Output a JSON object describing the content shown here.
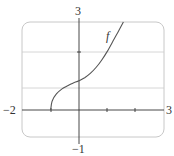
{
  "chart_data": {
    "type": "line",
    "title": "",
    "xlabel": "",
    "ylabel": "",
    "xlim": [
      -2,
      3
    ],
    "ylim": [
      -1,
      3
    ],
    "grid": true,
    "grid_lines_y": [
      0.75,
      2
    ],
    "x_tick_marks": [
      -1,
      1,
      2
    ],
    "y_tick_marks": [
      2
    ],
    "tick_labels": {
      "x_min": "−2",
      "x_max": "3",
      "y_max": "3",
      "y_min": "−1"
    },
    "series": [
      {
        "name": "f",
        "x": [
          -1,
          -0.95,
          -0.8,
          -0.6,
          -0.4,
          -0.2,
          0,
          0.2,
          0.4,
          0.6,
          0.8,
          1.0,
          1.2,
          1.4,
          1.57
        ],
        "y": [
          0,
          0.3,
          0.55,
          0.72,
          0.83,
          0.92,
          1.0,
          1.1,
          1.25,
          1.45,
          1.7,
          2.0,
          2.35,
          2.7,
          3.0
        ]
      }
    ],
    "annotations": [
      {
        "text": "f",
        "x": 1.05,
        "y": 2.5
      }
    ]
  },
  "labels": {
    "x_min": "−2",
    "x_max": "3",
    "y_max": "3",
    "y_min": "−1",
    "function": "f"
  },
  "colors": {
    "axis": "#333333",
    "curve": "#555555",
    "grid": "#cccccc",
    "frame": "#c8c8c8"
  }
}
